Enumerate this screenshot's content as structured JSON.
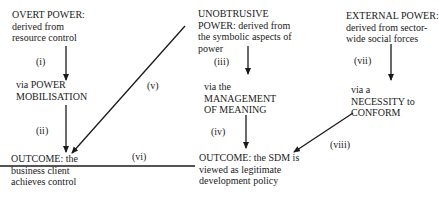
{
  "nodes": {
    "overt_power": [
      "OVERT POWER:",
      "derived from",
      "resource control"
    ],
    "power_mobilisation": [
      "via POWER",
      "MOBILISATION"
    ],
    "unobtrusive_power": [
      "UNOBTRUSIVE",
      "POWER: derived from",
      "the symbolic aspects of",
      "power"
    ],
    "management_of_meaning": [
      "via the",
      "MANAGEMENT",
      "OF MEANING"
    ],
    "external_power": [
      "EXTERNAL POWER:",
      "derived from sector-",
      "wide social forces"
    ],
    "necessity_to_conform": [
      "via  a",
      "NECESSITY to",
      "CONFORM"
    ],
    "outcome_control": [
      "OUTCOME: the",
      "business client",
      "achieves control"
    ],
    "outcome_sdm": [
      "OUTCOME: the SDM is",
      "viewed as legitimate",
      "development policy"
    ]
  },
  "edges": {
    "i": "(i)",
    "ii": "(ii)",
    "iii": "(iii)",
    "iv": "(iv)",
    "v": "(v)",
    "vi": "(vi)",
    "vii": "(vii)",
    "viii": "(viii)"
  }
}
